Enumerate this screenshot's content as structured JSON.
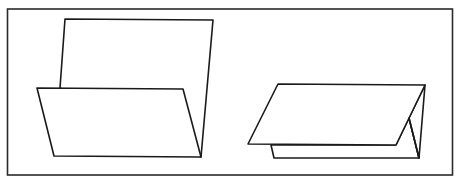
{
  "diagram": {
    "colors": {
      "stroke": "#1a1a1a",
      "background": "#ffffff"
    },
    "figures": [
      {
        "name": "standing-fold-card",
        "label": ""
      },
      {
        "name": "tent-fold-card",
        "label": ""
      }
    ]
  }
}
